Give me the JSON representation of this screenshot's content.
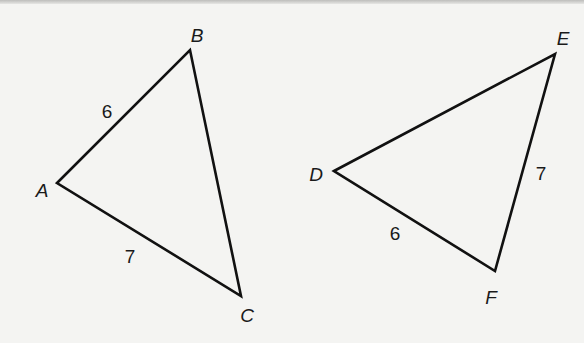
{
  "figure": {
    "triangles": [
      {
        "name": "triangle-abc",
        "vertices": [
          {
            "label": "A",
            "x": 57,
            "y": 183,
            "label_x": 42,
            "label_y": 197
          },
          {
            "label": "B",
            "x": 190,
            "y": 50,
            "label_x": 197,
            "label_y": 42
          },
          {
            "label": "C",
            "x": 241,
            "y": 296,
            "label_x": 247,
            "label_y": 322
          }
        ],
        "sides": [
          {
            "between": "AB",
            "length": "6",
            "label_x": 107,
            "label_y": 118
          },
          {
            "between": "AC",
            "length": "7",
            "label_x": 130,
            "label_y": 263
          }
        ]
      },
      {
        "name": "triangle-def",
        "vertices": [
          {
            "label": "D",
            "x": 334,
            "y": 171,
            "label_x": 316,
            "label_y": 181
          },
          {
            "label": "E",
            "x": 555,
            "y": 54,
            "label_x": 563,
            "label_y": 45
          },
          {
            "label": "F",
            "x": 495,
            "y": 271,
            "label_x": 491,
            "label_y": 304
          }
        ],
        "sides": [
          {
            "between": "EF",
            "length": "7",
            "label_x": 541,
            "label_y": 180
          },
          {
            "between": "DF",
            "length": "6",
            "label_x": 395,
            "label_y": 240
          }
        ]
      }
    ],
    "colors": {
      "line": "#111111",
      "text": "#1a1a1a",
      "background": "#f4f4f2"
    }
  }
}
